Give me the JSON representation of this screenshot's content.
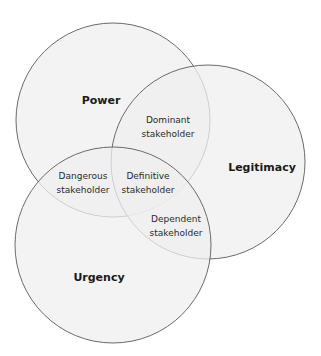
{
  "diagram": {
    "type": "venn",
    "colors": {
      "fill": "#efefef",
      "stroke": "#5a5a5a",
      "background": "#ffffff"
    },
    "circles": [
      {
        "id": "power",
        "label": "Power"
      },
      {
        "id": "legitimacy",
        "label": "Legitimacy"
      },
      {
        "id": "urgency",
        "label": "Urgency"
      }
    ],
    "regions": {
      "dominant": [
        "Dominant",
        "stakeholder"
      ],
      "dangerous": [
        "Dangerous",
        "stakeholder"
      ],
      "definitive": [
        "Definitive",
        "stakeholder"
      ],
      "dependent": [
        "Dependent",
        "stakeholder"
      ]
    }
  }
}
